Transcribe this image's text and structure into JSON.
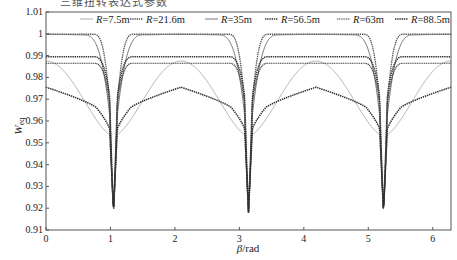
{
  "chart_data": {
    "type": "line",
    "title": "",
    "xlabel": "β/rad",
    "ylabel": "W_eq",
    "xlim": [
      0,
      6.2832
    ],
    "ylim": [
      0.91,
      1.01
    ],
    "grid": false,
    "legend_position": "top-inside",
    "x_ticks": [
      "0",
      "1",
      "2",
      "3",
      "4",
      "5",
      "6"
    ],
    "y_ticks": [
      "0.91",
      "0.92",
      "0.93",
      "0.94",
      "0.95",
      "0.96",
      "0.97",
      "0.98",
      "0.99",
      "1",
      "1.01"
    ],
    "dip_positions": [
      1.047,
      3.1416,
      5.236
    ],
    "dip_minimum": 0.918,
    "series": [
      {
        "name": "R=7.5m",
        "color": "#a8a8a8",
        "dash": "",
        "width": 0.9,
        "edge_value": 0.988,
        "plateau": 0.9875,
        "shape": "sine",
        "near_dip": 0.953
      },
      {
        "name": "R=21.6m",
        "color": "#555555",
        "dash": "1.4 0.8",
        "width": 1.3,
        "edge_value": 0.9998,
        "plateau": 0.9998,
        "shape": "flat",
        "near_dip": 0.94
      },
      {
        "name": "R=35m",
        "color": "#777777",
        "dash": "",
        "width": 1.0,
        "edge_value": 0.9998,
        "plateau": 0.9998,
        "shape": "flatround",
        "near_dip": 0.945
      },
      {
        "name": "R=56.5m",
        "color": "#333333",
        "dash": "1.4 0.8",
        "width": 1.5,
        "edge_value": 0.9905,
        "plateau": 0.9895,
        "shape": "flat",
        "near_dip": 0.955
      },
      {
        "name": "R=63m",
        "color": "#444444",
        "dash": "1.2 0.6",
        "width": 1.2,
        "edge_value": 0.988,
        "plateau": 0.9865,
        "shape": "flat",
        "near_dip": 0.952
      },
      {
        "name": "R=88.5m",
        "color": "#2a2a2a",
        "dash": "1.4 0.8",
        "width": 1.5,
        "edge_value": 0.9765,
        "plateau": 0.9755,
        "shape": "hump",
        "near_dip": 0.95
      }
    ]
  },
  "page": {
    "top_cropped_text": "三维扭转表达式参数"
  }
}
